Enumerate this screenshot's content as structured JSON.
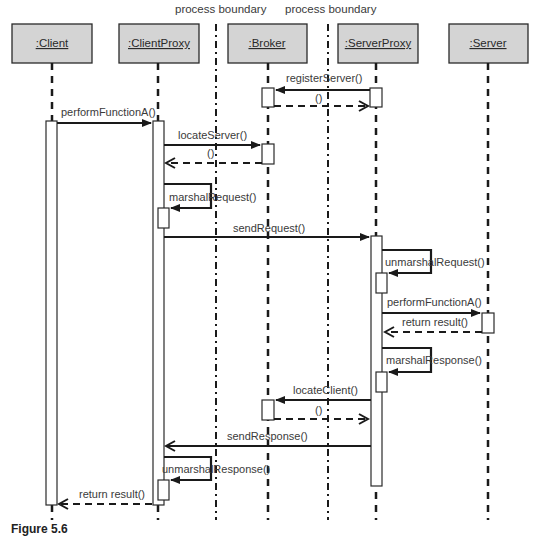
{
  "figure_caption": "Figure 5.6",
  "boundaries": [
    {
      "label": "process boundary"
    },
    {
      "label": "process boundary"
    }
  ],
  "objects": [
    {
      "id": "client",
      "label": ":Client"
    },
    {
      "id": "clientproxy",
      "label": ":ClientProxy"
    },
    {
      "id": "broker",
      "label": ":Broker"
    },
    {
      "id": "serverproxy",
      "label": ":ServerProxy"
    },
    {
      "id": "server",
      "label": ":Server"
    }
  ],
  "messages": [
    {
      "label": "registerServer()",
      "from": "serverproxy",
      "to": "broker",
      "kind": "call"
    },
    {
      "label": "()",
      "from": "broker",
      "to": "serverproxy",
      "kind": "return"
    },
    {
      "label": "performFunctionA()",
      "from": "client",
      "to": "clientproxy",
      "kind": "call"
    },
    {
      "label": "locateServer()",
      "from": "clientproxy",
      "to": "broker",
      "kind": "call"
    },
    {
      "label": "()",
      "from": "broker",
      "to": "clientproxy",
      "kind": "return"
    },
    {
      "label": "marshalRequest()",
      "from": "clientproxy",
      "to": "clientproxy",
      "kind": "self"
    },
    {
      "label": "sendRequest()",
      "from": "clientproxy",
      "to": "serverproxy",
      "kind": "call"
    },
    {
      "label": "unmarshalRequest()",
      "from": "serverproxy",
      "to": "serverproxy",
      "kind": "self"
    },
    {
      "label": "performFunctionA()",
      "from": "serverproxy",
      "to": "server",
      "kind": "call"
    },
    {
      "label": "return result()",
      "from": "server",
      "to": "serverproxy",
      "kind": "return"
    },
    {
      "label": "marshalResponse()",
      "from": "serverproxy",
      "to": "serverproxy",
      "kind": "self"
    },
    {
      "label": "locateClient()",
      "from": "serverproxy",
      "to": "broker",
      "kind": "call"
    },
    {
      "label": "()",
      "from": "broker",
      "to": "serverproxy",
      "kind": "return"
    },
    {
      "label": "sendResponse()",
      "from": "serverproxy",
      "to": "clientproxy",
      "kind": "call"
    },
    {
      "label": "unmarshalResponse()",
      "from": "clientproxy",
      "to": "clientproxy",
      "kind": "self"
    },
    {
      "label": "return result()",
      "from": "clientproxy",
      "to": "client",
      "kind": "return"
    }
  ],
  "colors": {
    "object_fill": "#d4d4d4",
    "line": "#1a1a1a",
    "text": "#3a3a3a"
  }
}
